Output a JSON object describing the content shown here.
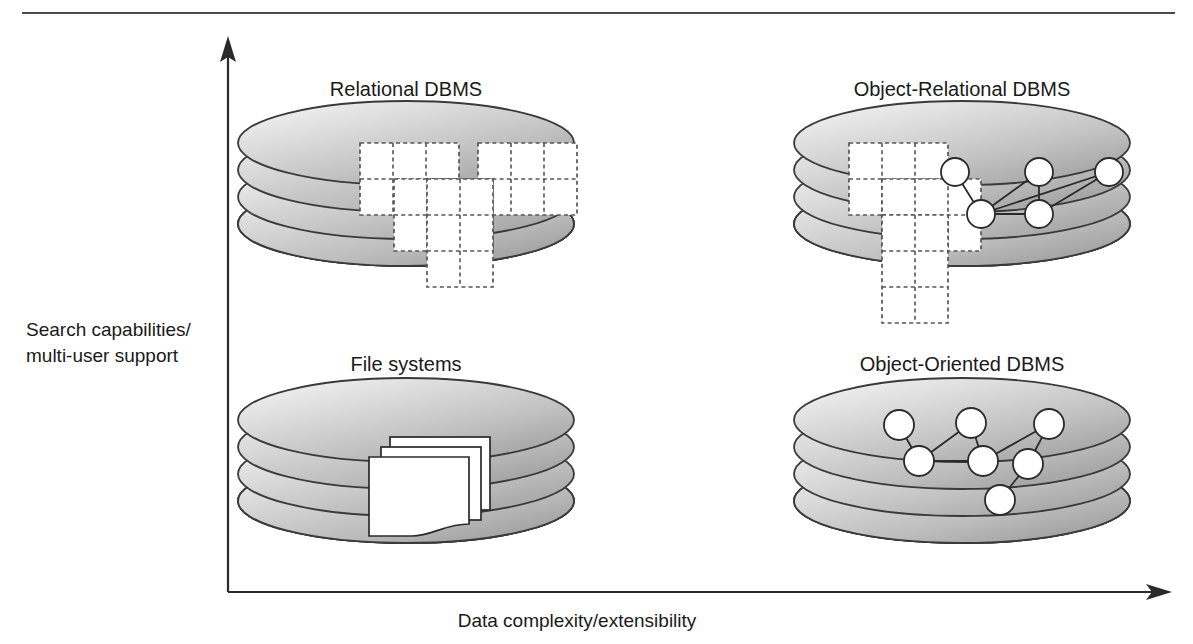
{
  "figure": {
    "kind": "quadrant-diagram",
    "background_color": "#ffffff",
    "ink_color": "#1a1a1a",
    "top_rule_color": "#4a4a4a"
  },
  "axes": {
    "y_label_line1": "Search capabilities/",
    "y_label_line2": "multi-user support",
    "x_label": "Data complexity/extensibility",
    "y_axis_direction": "up",
    "x_axis_direction": "right",
    "origin_px": [
      228,
      592
    ],
    "y_tip_px": [
      228,
      42
    ],
    "x_tip_px": [
      1167,
      592
    ]
  },
  "quadrants": [
    {
      "id": "relational-dbms",
      "title": "Relational DBMS",
      "position": "upper-left",
      "title_center_px": [
        406,
        89
      ],
      "disk_center_px": [
        406,
        178
      ],
      "content_type": "tables",
      "table_count": 3,
      "description": "Three overlapping dashed-grid tables on a disk stack"
    },
    {
      "id": "object-relational-dbms",
      "title": "Object-Relational DBMS",
      "position": "upper-right",
      "title_center_px": [
        962,
        89
      ],
      "disk_center_px": [
        962,
        178
      ],
      "content_type": "tables-and-objects",
      "table_count": 3,
      "node_count": 5,
      "description": "Dashed-grid tables on the left plus a linked object graph on the right"
    },
    {
      "id": "file-systems",
      "title": "File systems",
      "position": "lower-left",
      "title_center_px": [
        406,
        364
      ],
      "disk_center_px": [
        406,
        455
      ],
      "content_type": "documents",
      "document_count": 3,
      "description": "Three overlapping document sheets with a wavy lower edge"
    },
    {
      "id": "object-oriented-dbms",
      "title": "Object-Oriented DBMS",
      "position": "lower-right",
      "title_center_px": [
        962,
        364
      ],
      "disk_center_px": [
        962,
        455
      ],
      "content_type": "objects",
      "node_count": 7,
      "description": "A linked object graph of seven nodes on a disk stack"
    }
  ],
  "disk_stack": {
    "platter_count": 4,
    "rx": 168,
    "ry": 42,
    "platter_spacing": 27,
    "fill_light": "#f1f1f1",
    "fill_mid": "#c9c9c9",
    "fill_dark": "#9a9a9a",
    "outline_color": "#3a3a3a"
  }
}
